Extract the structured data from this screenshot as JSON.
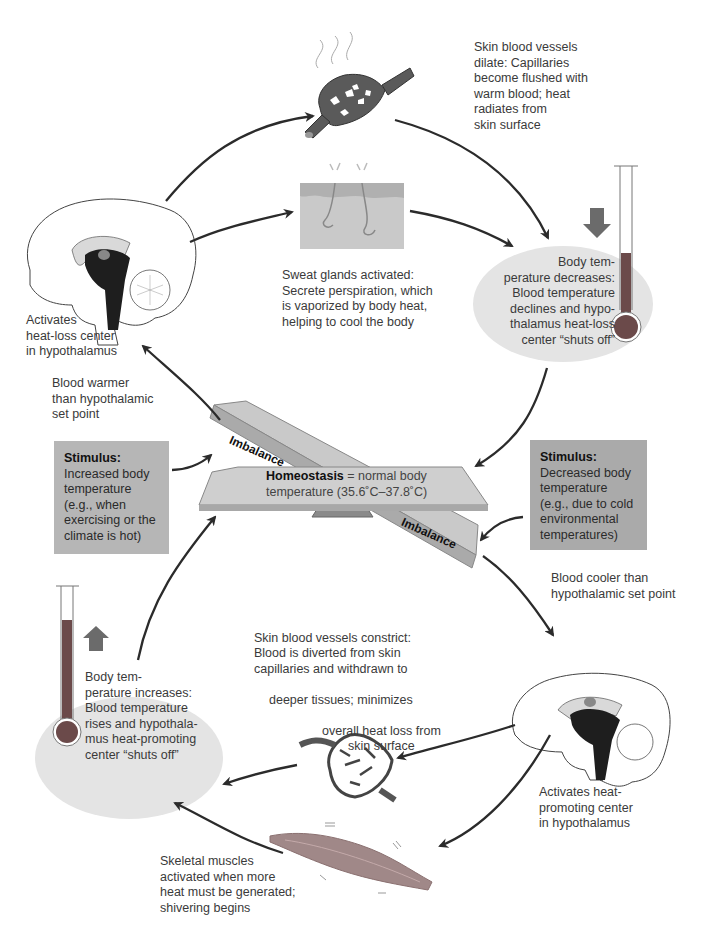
{
  "diagram": {
    "colors": {
      "arrow": "#2b2b2b",
      "stimulus_box": "#b3b3b3",
      "response_ellipse": "#e4e4e4",
      "thermometer_fluid": "#6b4a4a",
      "seesaw": "#c4c4c4",
      "fulcrum": "#8a8a8a"
    }
  },
  "top_loop": {
    "vessels_dilate": "Skin blood vessels\ndilate: Capillaries\nbecome flushed with\nwarm blood; heat\nradiates from\nskin surface",
    "sweat_glands": "Sweat glands activated:\nSecrete perspiration, which\nis vaporized by body heat,\nhelping to cool the body",
    "brain_label": "Activates\nheat-loss center\nin hypothalamus",
    "blood_warmer": "Blood warmer\nthan hypothalamic\nset point",
    "response": "Body tem-\nperature decreases:\nBlood temperature\ndeclines and hypo-\nthalamus heat-loss\ncenter “shuts off”",
    "response_arrow": "down-arrow"
  },
  "center": {
    "homeostasis_bold": "Homeostasis",
    "homeostasis_rest": " = normal body",
    "homeostasis_range": "temperature (35.6˚C–37.8˚C)",
    "imbalance_left": "Imbalance",
    "imbalance_right": "Imbalance"
  },
  "stimulus_left": {
    "heading": "Stimulus:",
    "text": "Increased body\ntemperature\n(e.g., when\nexercising or the\nclimate is hot)"
  },
  "stimulus_right": {
    "heading": "Stimulus:",
    "text": "Decreased body\ntemperature\n(e.g., due to cold\nenvironmental\ntemperatures)"
  },
  "bottom_loop": {
    "blood_cooler": "Blood cooler than\nhypothalamic set point",
    "brain_label": "Activates heat-\npromoting center\nin hypothalamus",
    "vessels_constrict_1": "Skin blood vessels constrict:\nBlood is diverted from skin\ncapillaries and withdrawn to",
    "vessels_constrict_2": "deeper tissues; minimizes",
    "vessels_constrict_3": "overall heat loss from\nskin surface",
    "muscles": "Skeletal muscles\nactivated when more\nheat must be generated;\nshivering begins",
    "response": "Body tem-\nperature increases:\nBlood temperature\nrises and hypothala-\nmus heat-promoting\ncenter “shuts off”",
    "response_arrow": "up-arrow"
  }
}
